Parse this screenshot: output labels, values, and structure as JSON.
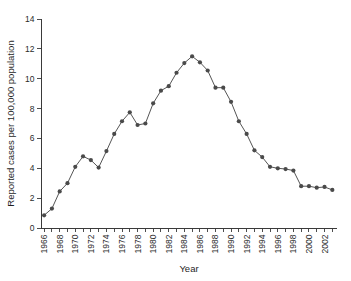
{
  "chart_data": {
    "type": "line",
    "title": "",
    "xlabel": "Year",
    "ylabel": "Reported cases per 100,000 population",
    "xlim": [
      1965.6,
      2003.6
    ],
    "ylim": [
      0,
      14
    ],
    "ytick_values": [
      0,
      2,
      4,
      6,
      8,
      10,
      12,
      14
    ],
    "ytick_labels": [
      "0",
      "2",
      "4",
      "6",
      "8",
      "10",
      "12",
      "14"
    ],
    "xtick_labels": [
      "1966",
      "1968",
      "1970",
      "1972",
      "1974",
      "1976",
      "1978",
      "1980",
      "1982",
      "1984",
      "1986",
      "1988",
      "1990",
      "1992",
      "1994",
      "1996",
      "1998",
      "2000",
      "2002"
    ],
    "xtick_label_rotation": -90,
    "xtick_interval_minor": 1,
    "xtick_interval_major": 2,
    "grid": false,
    "legend": false,
    "marker": "filled-circle",
    "marker_color": "#4a4a4a",
    "line_color": "#555555",
    "x": [
      1966,
      1967,
      1968,
      1969,
      1970,
      1971,
      1972,
      1973,
      1974,
      1975,
      1976,
      1977,
      1978,
      1979,
      1980,
      1981,
      1982,
      1983,
      1984,
      1985,
      1986,
      1987,
      1988,
      1989,
      1990,
      1991,
      1992,
      1993,
      1994,
      1995,
      1996,
      1997,
      1998,
      1999,
      2000,
      2001,
      2002,
      2003
    ],
    "values": [
      0.85,
      1.3,
      2.45,
      3.0,
      4.1,
      4.8,
      4.55,
      4.05,
      5.15,
      6.3,
      7.15,
      7.75,
      6.9,
      7.0,
      8.35,
      9.2,
      9.5,
      10.4,
      11.05,
      11.5,
      11.1,
      10.55,
      9.4,
      9.4,
      8.45,
      7.15,
      6.3,
      5.2,
      4.75,
      4.1,
      4.0,
      3.95,
      3.85,
      2.8,
      2.8,
      2.7,
      2.75,
      2.55
    ]
  }
}
